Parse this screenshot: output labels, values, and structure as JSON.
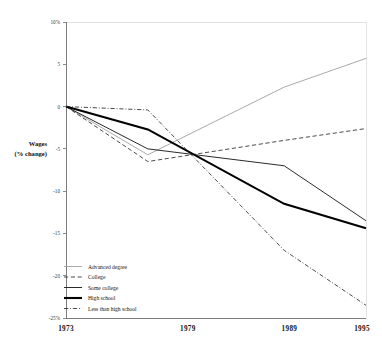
{
  "chart_data": {
    "type": "line",
    "title": "",
    "xlabel": "",
    "ylabel": "Wages\n(% change)",
    "ylabel_line1": "Wages",
    "ylabel_line2": "(% change)",
    "x": [
      1973,
      1979,
      1989,
      1995
    ],
    "categories": [
      "1973",
      "1979",
      "1989",
      "1995"
    ],
    "xlim": [
      1973,
      1995
    ],
    "ylim": [
      -25,
      10
    ],
    "grid": false,
    "legend_position": "bottom-left",
    "ytick_labels": [
      "10%",
      "5",
      "0",
      "-5",
      "-10",
      "-15",
      "-20",
      "-25%"
    ],
    "ytick_values": [
      10,
      5,
      0,
      -5,
      -10,
      -15,
      -20,
      -25
    ],
    "series": [
      {
        "name": "Advanced degree",
        "style": "thin-solid-gray",
        "color": "#9a9a9a",
        "values": [
          0,
          -5.7,
          2.3,
          5.7
        ]
      },
      {
        "name": "College",
        "style": "dashed",
        "color": "#2b2b2b",
        "values": [
          0,
          -6.5,
          -4.0,
          -2.6
        ]
      },
      {
        "name": "Some college",
        "style": "medium-solid",
        "color": "#2b2b2b",
        "values": [
          0,
          -5.0,
          -7.0,
          -13.5
        ]
      },
      {
        "name": "High school",
        "style": "thick-solid",
        "color": "#000000",
        "values": [
          0,
          -2.7,
          -11.5,
          -14.4
        ]
      },
      {
        "name": "Less than high school",
        "style": "dash-dot",
        "color": "#2b2b2b",
        "values": [
          0,
          -0.4,
          -17.0,
          -23.5
        ]
      }
    ]
  },
  "axis": {
    "y_title_line1": "Wages",
    "y_title_line2": "(% change)",
    "yticks": [
      {
        "label": "10%",
        "value": 10
      },
      {
        "label": "5",
        "value": 5
      },
      {
        "label": "0",
        "value": 0
      },
      {
        "label": "-5",
        "value": -5
      },
      {
        "label": "-10",
        "value": -10
      },
      {
        "label": "-15",
        "value": -15
      },
      {
        "label": "-20",
        "value": -20
      },
      {
        "label": "-25%",
        "value": -25
      }
    ],
    "xticks": [
      {
        "label": "1973",
        "value": 1973
      },
      {
        "label": "1979",
        "value": 1979
      },
      {
        "label": "1989",
        "value": 1989
      },
      {
        "label": "1995",
        "value": 1995
      }
    ]
  },
  "legend": {
    "items": [
      {
        "label": "Advanced degree",
        "style": "thin-solid-gray"
      },
      {
        "label": "College",
        "style": "dashed"
      },
      {
        "label": "Some college",
        "style": "medium-solid"
      },
      {
        "label": "High school",
        "style": "thick-solid"
      },
      {
        "label": "Less than high school",
        "style": "dash-dot"
      }
    ]
  }
}
